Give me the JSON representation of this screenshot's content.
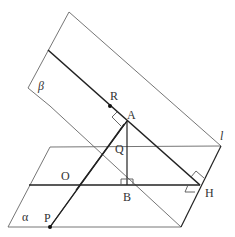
{
  "figure": {
    "type": "3d-geometry",
    "planes": [
      {
        "name": "beta",
        "label": "β"
      },
      {
        "name": "alpha",
        "label": "α"
      }
    ],
    "line_label": "l",
    "points": {
      "R": "R",
      "A": "A",
      "Q": "Q",
      "O": "O",
      "B": "B",
      "H": "H",
      "P": "P"
    },
    "right_angle_marks": [
      "at A",
      "at B",
      "at H (two)"
    ],
    "colors": {
      "thin_line": "#666666",
      "thick_line": "#222222",
      "label": "#333333"
    }
  }
}
